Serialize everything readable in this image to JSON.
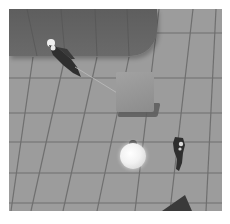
{
  "scene": {
    "type": "3d-top-down-game-view",
    "colors": {
      "floor": "#9c9c9c",
      "grid_line": "#6f6f6f",
      "platform": "#626262",
      "box": "#979797",
      "sphere": "#f4f4f4",
      "characters": "#2e2e2e",
      "wedge": "#3a3a3a"
    },
    "objects": [
      {
        "name": "raised-platform",
        "description": "dark gray platform with rounded corner"
      },
      {
        "name": "player-character-1",
        "description": "dark humanoid figure lying on platform"
      },
      {
        "name": "box",
        "description": "gray cube on the floor"
      },
      {
        "name": "glowing-sphere",
        "description": "white glowing ball"
      },
      {
        "name": "player-character-2",
        "description": "dark humanoid figure standing"
      },
      {
        "name": "dark-wedge",
        "description": "dark triangular object at bottom edge"
      }
    ]
  }
}
